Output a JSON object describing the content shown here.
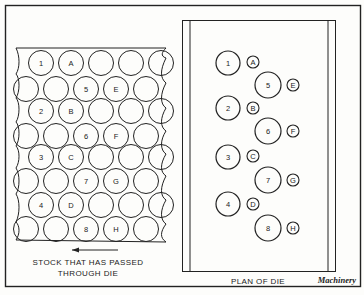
{
  "figure": {
    "stock": {
      "caption_line1": "STOCK THAT HAS PASSED",
      "caption_line2": "THROUGH DIE",
      "arrow_direction": "left",
      "rows": [
        {
          "y": 63,
          "xs": [
            41,
            71,
            101,
            131,
            161
          ],
          "labels": [
            "1",
            "A",
            "",
            "",
            ""
          ]
        },
        {
          "y": 89,
          "xs": [
            26,
            56,
            86,
            116,
            146
          ],
          "labels": [
            "",
            "",
            "5",
            "E",
            ""
          ]
        },
        {
          "y": 111,
          "xs": [
            41,
            71,
            101,
            131,
            161
          ],
          "labels": [
            "2",
            "B",
            "",
            "",
            ""
          ]
        },
        {
          "y": 136,
          "xs": [
            26,
            56,
            86,
            116,
            146
          ],
          "labels": [
            "",
            "",
            "6",
            "F",
            ""
          ]
        },
        {
          "y": 157,
          "xs": [
            41,
            71,
            101,
            131,
            161
          ],
          "labels": [
            "3",
            "C",
            "",
            "",
            ""
          ]
        },
        {
          "y": 181,
          "xs": [
            26,
            56,
            86,
            116,
            146
          ],
          "labels": [
            "",
            "",
            "7",
            "G",
            ""
          ]
        },
        {
          "y": 205,
          "xs": [
            41,
            71,
            101,
            131,
            161
          ],
          "labels": [
            "4",
            "D",
            "",
            "",
            ""
          ]
        },
        {
          "y": 229,
          "xs": [
            26,
            56,
            86,
            116,
            146
          ],
          "labels": [
            "",
            "",
            "8",
            "H",
            ""
          ]
        }
      ]
    },
    "die": {
      "caption": "PLAN OF DIE",
      "holes": [
        {
          "label": "1",
          "x": 228,
          "y": 63,
          "r": 12,
          "small_label": "A",
          "sx": 253,
          "sy": 62
        },
        {
          "label": "5",
          "x": 268,
          "y": 85,
          "r": 13,
          "small_label": "E",
          "sx": 293,
          "sy": 85
        },
        {
          "label": "2",
          "x": 228,
          "y": 108,
          "r": 12,
          "small_label": "B",
          "sx": 253,
          "sy": 108
        },
        {
          "label": "6",
          "x": 268,
          "y": 131,
          "r": 13,
          "small_label": "F",
          "sx": 293,
          "sy": 131
        },
        {
          "label": "3",
          "x": 228,
          "y": 157,
          "r": 12,
          "small_label": "C",
          "sx": 253,
          "sy": 156
        },
        {
          "label": "7",
          "x": 268,
          "y": 180,
          "r": 13,
          "small_label": "G",
          "sx": 293,
          "sy": 180
        },
        {
          "label": "4",
          "x": 228,
          "y": 204,
          "r": 12,
          "small_label": "D",
          "sx": 253,
          "sy": 204
        },
        {
          "label": "8",
          "x": 268,
          "y": 228,
          "r": 13,
          "small_label": "H",
          "sx": 293,
          "sy": 228
        }
      ]
    },
    "credit": "Machinery",
    "colors": {
      "ink": "#222222",
      "paper": "#fdfdfb"
    }
  }
}
